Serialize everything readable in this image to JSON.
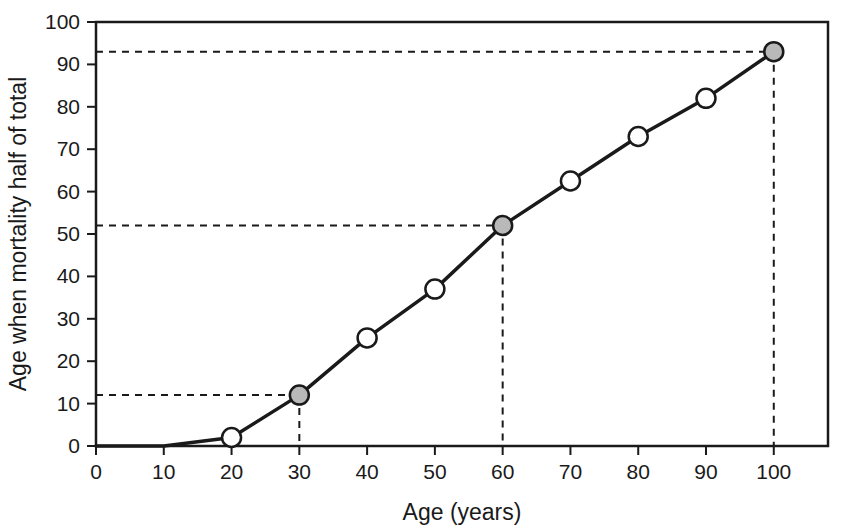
{
  "chart_data": {
    "type": "line",
    "title": "",
    "subtitle": "",
    "xlabel": "Age (years)",
    "ylabel": "Age when mortality half of total",
    "xlim": [
      0,
      108
    ],
    "ylim": [
      0,
      100
    ],
    "xticks": [
      0,
      10,
      20,
      30,
      40,
      50,
      60,
      70,
      80,
      90,
      100
    ],
    "yticks": [
      0,
      10,
      20,
      30,
      40,
      50,
      60,
      70,
      80,
      90,
      100
    ],
    "xtick_labels": [
      "0",
      "10",
      "20",
      "30",
      "40",
      "50",
      "60",
      "70",
      "80",
      "90",
      "100"
    ],
    "ytick_labels": [
      "0",
      "10",
      "20",
      "30",
      "40",
      "50",
      "60",
      "70",
      "80",
      "90",
      "100"
    ],
    "grid": false,
    "legend": null,
    "series": [
      {
        "name": "Age when mortality half of total",
        "x": [
          0,
          10,
          20,
          30,
          40,
          50,
          60,
          70,
          80,
          90,
          100
        ],
        "values": [
          0,
          0,
          2,
          12,
          25.5,
          37,
          52,
          62.5,
          73,
          82,
          93
        ],
        "line_color": "#1a1a1a",
        "line_width": 3.5,
        "markers": [
          {
            "x": 0,
            "y": 0,
            "style": "none"
          },
          {
            "x": 10,
            "y": 0,
            "style": "none"
          },
          {
            "x": 20,
            "y": 2,
            "style": "open"
          },
          {
            "x": 30,
            "y": 12,
            "style": "filled"
          },
          {
            "x": 40,
            "y": 25.5,
            "style": "open"
          },
          {
            "x": 50,
            "y": 37,
            "style": "open"
          },
          {
            "x": 60,
            "y": 52,
            "style": "filled"
          },
          {
            "x": 70,
            "y": 62.5,
            "style": "open"
          },
          {
            "x": 80,
            "y": 73,
            "style": "open"
          },
          {
            "x": 90,
            "y": 82,
            "style": "open"
          },
          {
            "x": 100,
            "y": 93,
            "style": "filled"
          }
        ],
        "marker_open_fill": "#ffffff",
        "marker_filled_fill": "#b9b9b9",
        "marker_edge_color": "#1a1a1a"
      }
    ],
    "annotations": [
      {
        "type": "reference",
        "x": 30,
        "y": 12,
        "label": "",
        "style": "dashed"
      },
      {
        "type": "reference",
        "x": 60,
        "y": 52,
        "label": "",
        "style": "dashed"
      },
      {
        "type": "reference",
        "x": 100,
        "y": 93,
        "label": "",
        "style": "dashed"
      }
    ],
    "frame_color": "#1a1a1a",
    "background": "#ffffff"
  }
}
